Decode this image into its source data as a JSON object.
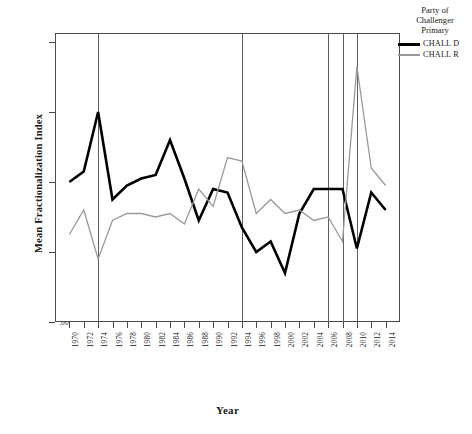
{
  "chart_data": {
    "type": "line",
    "title": "",
    "xlabel": "Year",
    "ylabel": "Mean Fractionalization Index",
    "x": [
      1970,
      1972,
      1974,
      1976,
      1978,
      1980,
      1982,
      1984,
      1986,
      1988,
      1990,
      1992,
      1994,
      1996,
      1998,
      2000,
      2002,
      2004,
      2006,
      2008,
      2010,
      2012,
      2014
    ],
    "xlim": [
      1969,
      2015
    ],
    "ylim": [
      0.0,
      0.43
    ],
    "yticks": [
      0.0,
      0.1,
      0.2,
      0.3,
      0.4
    ],
    "ytick_labels": [
      ".00",
      ".10",
      ".20",
      ".30",
      ".40"
    ],
    "xtick_labels": [
      "1970",
      "1972",
      "1974",
      "1976",
      "1978",
      "1980",
      "1982",
      "1984",
      "1986",
      "1988",
      "1990",
      "1992",
      "1994",
      "1996",
      "1998",
      "2000",
      "2002",
      "2004",
      "2006",
      "2008",
      "2010",
      "2012",
      "2014"
    ],
    "grid": false,
    "legend_position": "right",
    "reference_lines": [
      1974,
      1994,
      2006,
      2008,
      2010
    ],
    "series": [
      {
        "name": "CHALL D",
        "color": "#000000",
        "width": 2.6,
        "values": [
          0.2,
          0.215,
          0.3,
          0.175,
          0.195,
          0.205,
          0.21,
          0.26,
          0.205,
          0.145,
          0.19,
          0.185,
          0.135,
          0.1,
          0.115,
          0.07,
          0.155,
          0.19,
          0.19,
          0.19,
          0.105,
          0.185,
          0.16
        ]
      },
      {
        "name": "CHALL R",
        "color": "#9a9a9a",
        "width": 1.3,
        "values": [
          0.125,
          0.16,
          0.09,
          0.145,
          0.155,
          0.155,
          0.15,
          0.155,
          0.14,
          0.19,
          0.165,
          0.235,
          0.23,
          0.155,
          0.175,
          0.155,
          0.16,
          0.145,
          0.15,
          0.115,
          0.365,
          0.22,
          0.195
        ]
      }
    ]
  },
  "legend": {
    "title_line1": "Party of",
    "title_line2": "Challenger",
    "title_line3": "Primary",
    "entries": [
      {
        "label": "CHALL D"
      },
      {
        "label": "CHALL R"
      }
    ]
  },
  "caption": "",
  "colors": {
    "chall_d": "#000000",
    "chall_r": "#9a9a9a",
    "axis": "#4a4a4a",
    "reference_line": "#5e5e5e"
  }
}
